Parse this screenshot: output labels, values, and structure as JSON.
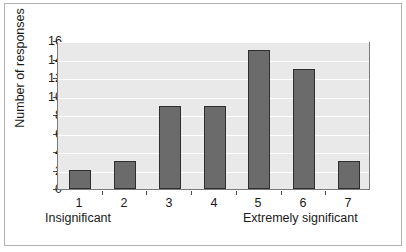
{
  "chart_data": {
    "type": "bar",
    "title": "",
    "subtitle": "",
    "xlabel": "",
    "ylabel": "Number of responses",
    "categories": [
      "1",
      "2",
      "3",
      "4",
      "5",
      "6",
      "7"
    ],
    "values": [
      2,
      3,
      9,
      9,
      15,
      13,
      3
    ],
    "series": [
      {
        "name": "Number of responses",
        "values": [
          2,
          3,
          9,
          9,
          15,
          13,
          3
        ]
      }
    ],
    "ylim": [
      0,
      16
    ],
    "ytick_labels": [
      "0",
      "2",
      "4",
      "6",
      "8",
      "10",
      "12",
      "14",
      "16"
    ],
    "ytick_values": [
      0,
      2,
      4,
      6,
      8,
      10,
      12,
      14,
      16
    ],
    "grid": true,
    "grid_axis": "y",
    "legend": false,
    "legend_position": "none",
    "scale_anchor_low": "Insignificant",
    "scale_anchor_high": "Extremely significant",
    "colors": {
      "bar_fill": "#6b6b6b",
      "bar_edge": "#2e2e2e",
      "plot_background": "#e9e9e9",
      "gridline": "#ffffff",
      "axis": "#7a7a7a",
      "text": "#1a1a1a",
      "figure_background": "#ffffff",
      "frame_border": "#b0b0b0"
    }
  }
}
